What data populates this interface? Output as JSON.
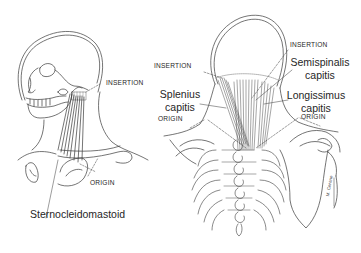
{
  "figure": {
    "left_panel": {
      "view": "lateral",
      "muscle_label": "Sternocleidomastoid",
      "insertion_label": "INSERTION",
      "origin_label": "ORIGIN"
    },
    "right_panel": {
      "view": "posterior",
      "labels": {
        "insertion_left": "INSERTION",
        "insertion_right": "INSERTION",
        "origin_left": "ORIGIN",
        "origin_right": "ORIGIN",
        "splenius_line1": "Splenius",
        "splenius_line2": "capitis",
        "semispinalis_line1": "Semispinalis",
        "semispinalis_line2": "capitis",
        "longissimus_line1": "Longissimus",
        "longissimus_line2": "capitis"
      },
      "artist_signature": "M. Cerone"
    },
    "colors": {
      "line": "#3a3a3a",
      "background": "#ffffff",
      "text": "#262626"
    }
  }
}
